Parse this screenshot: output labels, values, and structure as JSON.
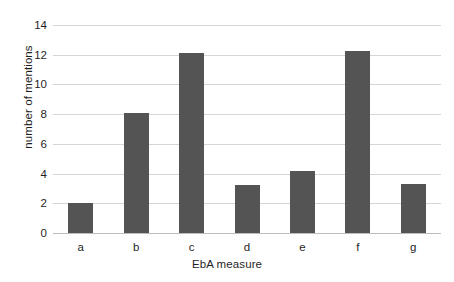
{
  "chart_data": {
    "type": "bar",
    "title": "",
    "subtitle": "",
    "xlabel": "EbA measure",
    "ylabel": "number of mentions",
    "categories": [
      "a",
      "b",
      "c",
      "d",
      "e",
      "f",
      "g"
    ],
    "values": [
      2.0,
      8.05,
      12.1,
      3.2,
      4.15,
      12.25,
      3.3
    ],
    "series": [
      {
        "name": "number of mentions",
        "values": [
          2.0,
          8.05,
          12.1,
          3.2,
          4.15,
          12.25,
          3.3
        ]
      }
    ],
    "ylim": [
      0,
      14
    ],
    "ytick_labels": [
      "0",
      "2",
      "4",
      "6",
      "8",
      "10",
      "12",
      "14"
    ],
    "ytick_values": [
      0,
      2,
      4,
      6,
      8,
      10,
      12,
      14
    ],
    "xtick_labels": [
      "a",
      "b",
      "c",
      "d",
      "e",
      "f",
      "g"
    ],
    "grid": "horizontal",
    "legend": "none",
    "colors": {
      "bar": "#545454",
      "gridline": "#d6d6d6",
      "axis": "#bdbdbd",
      "text": "#1f1f1f",
      "background": "#ffffff"
    }
  }
}
